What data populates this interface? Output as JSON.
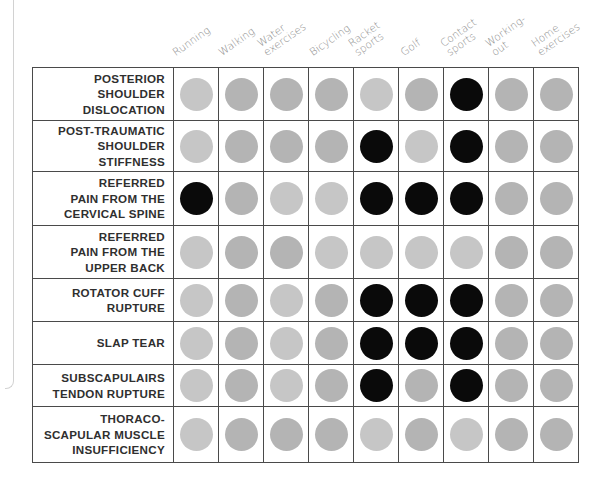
{
  "chart_data": {
    "type": "table",
    "title": "",
    "legend": {
      "black": "strongly associated",
      "gray": "not / weakly associated"
    },
    "columns": [
      "Running",
      "Walking",
      "Water exercises",
      "Bicycling",
      "Racket sports",
      "Golf",
      "Contact sports",
      "Working-out",
      "Home exercises"
    ],
    "column_labels": [
      "Running",
      "Walking",
      "Water\nexercises",
      "Bicycling",
      "Racket\nsports",
      "Golf",
      "Contact\nsports",
      "Working-\nout",
      "Home\nexercises"
    ],
    "rows": [
      {
        "label": "POSTERIOR\nSHOULDER\nDISLOCATION",
        "values": [
          "l",
          "m",
          "m",
          "m",
          "l",
          "m",
          "b",
          "m",
          "m"
        ],
        "height": 53
      },
      {
        "label": "POST-TRAUMATIC\nSHOULDER\nSTIFFNESS",
        "values": [
          "l",
          "m",
          "m",
          "m",
          "b",
          "l",
          "b",
          "m",
          "m"
        ],
        "height": 51
      },
      {
        "label": "REFERRED\nPAIN FROM THE\nCERVICAL SPINE",
        "values": [
          "b",
          "m",
          "l",
          "l",
          "b",
          "b",
          "b",
          "m",
          "m"
        ],
        "height": 54
      },
      {
        "label": "REFERRED\nPAIN FROM THE\nUPPER BACK",
        "values": [
          "l",
          "m",
          "m",
          "l",
          "l",
          "l",
          "l",
          "m",
          "m"
        ],
        "height": 53
      },
      {
        "label": "ROTATOR CUFF\nRUPTURE",
        "values": [
          "l",
          "m",
          "l",
          "m",
          "b",
          "b",
          "b",
          "m",
          "m"
        ],
        "height": 43
      },
      {
        "label": "SLAP TEAR",
        "values": [
          "l",
          "m",
          "l",
          "m",
          "b",
          "b",
          "b",
          "m",
          "m"
        ],
        "height": 43
      },
      {
        "label": "SUBSCAPULAIRS\nTENDON RUPTURE",
        "values": [
          "l",
          "m",
          "l",
          "m",
          "b",
          "m",
          "b",
          "m",
          "m"
        ],
        "height": 42
      },
      {
        "label": "THORACO-\nSCAPULAR MUSCLE\nINSUFFICIENCY",
        "values": [
          "l",
          "m",
          "m",
          "m",
          "l",
          "m",
          "l",
          "m",
          "m"
        ],
        "height": 56
      }
    ],
    "value_key": {
      "b": "black",
      "m": "medium gray",
      "l": "light gray"
    }
  },
  "colors": {
    "b": "#0a0a0a",
    "m": "#b4b4b4",
    "l": "#c6c6c6",
    "grid": "#4a4a4a",
    "header_text": "#8a8a8a"
  }
}
